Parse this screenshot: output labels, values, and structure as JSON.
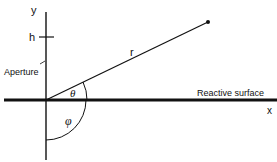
{
  "diagram": {
    "axes": {
      "x_label": "x",
      "y_label": "y"
    },
    "labels": {
      "h": "h",
      "aperture": "Aperture",
      "r": "r",
      "theta": "θ",
      "phi": "φ",
      "surface": "Reactive surface"
    },
    "colors": {
      "ink": "#111111",
      "background": "#ffffff"
    }
  }
}
